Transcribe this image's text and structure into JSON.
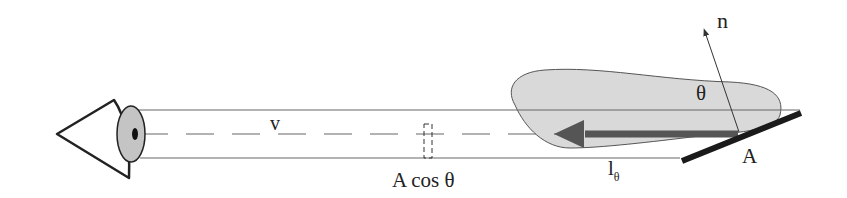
{
  "diagram": {
    "labels": {
      "view_vector": "v",
      "projected_area": "A cos θ",
      "normal": "n",
      "angle": "θ",
      "area": "A",
      "radiance_main": "l",
      "radiance_sub": "θ"
    },
    "colors": {
      "stroke": "#222222",
      "thin_line": "#666666",
      "blob_fill": "#d9d9d9",
      "iris_fill": "#c4c4c4",
      "arrow": "#555555",
      "plate": "#1a1a1a"
    }
  }
}
